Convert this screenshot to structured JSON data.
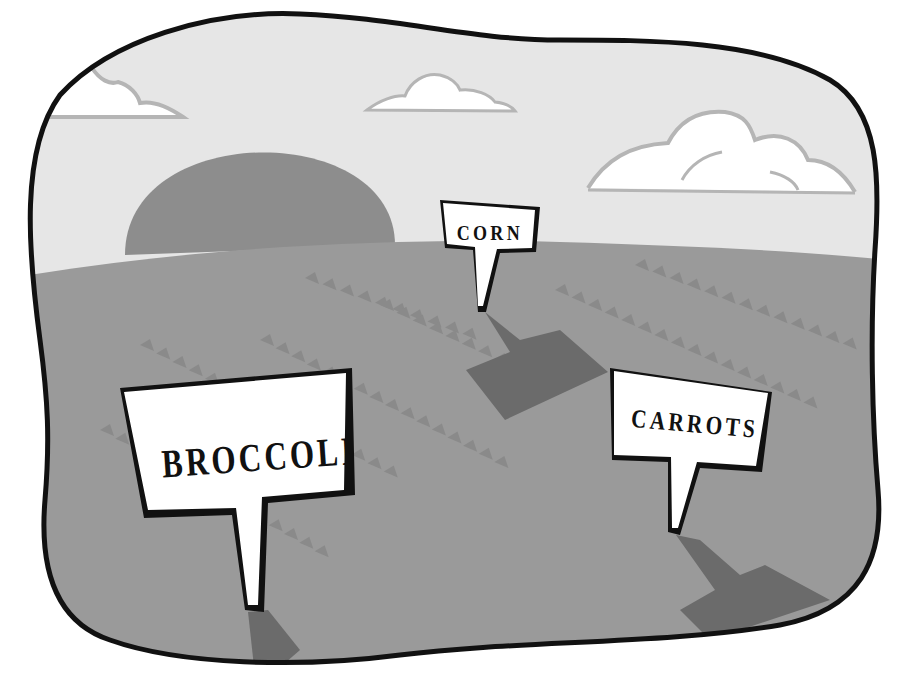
{
  "scene": {
    "description": "Farm field illustration with crop signs",
    "colors": {
      "sky": "#e6e6e6",
      "field": "#9a9a9a",
      "sun": "#8a8a8a",
      "cloud": "#ffffff",
      "cloud_shade": "#b5b5b5",
      "row_marks": "#8c8c8c",
      "shadow": "#6b6b6b",
      "outline": "#111111",
      "sign_bg": "#ffffff"
    }
  },
  "signs": [
    {
      "id": "corn",
      "label": "CORN"
    },
    {
      "id": "broccoli",
      "label": "BROCCOLI"
    },
    {
      "id": "carrots",
      "label": "CARROTS"
    }
  ]
}
